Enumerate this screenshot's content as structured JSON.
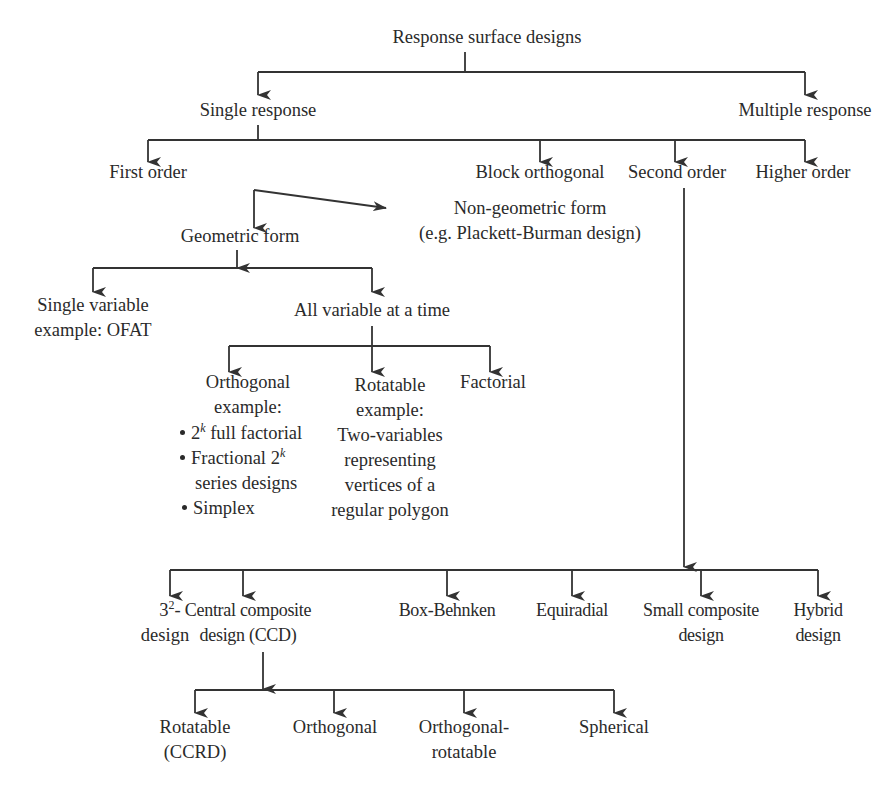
{
  "diagram": {
    "title": "Response surface designs",
    "level1": {
      "single": "Single response",
      "multiple": "Multiple response"
    },
    "level2": {
      "first_order": "First order",
      "block_orthogonal": "Block orthogonal",
      "second_order": "Second order",
      "higher_order": "Higher order"
    },
    "first_order_children": {
      "geometric": "Geometric form",
      "non_geometric_line1": "Non-geometric form",
      "non_geometric_line2": "(e.g. Plackett-Burman design)"
    },
    "geometric_children": {
      "single_variable_line1": "Single variable",
      "single_variable_line2": "example: OFAT",
      "all_variable": "All variable at a time"
    },
    "all_variable_children": {
      "orthogonal_line1": "Orthogonal",
      "orthogonal_line2": "example:",
      "orthogonal_bullets": [
        {
          "pre": "2",
          "sup": "k",
          "post": " full factorial"
        },
        {
          "pre": "Fractional 2",
          "sup": "k",
          "post": ""
        },
        {
          "cont": "series designs"
        },
        {
          "pre": "Simplex",
          "sup": "",
          "post": ""
        }
      ],
      "rotatable_lines": [
        "Rotatable",
        "example:",
        "Two-variables",
        "representing",
        "vertices of a",
        "regular polygon"
      ],
      "factorial": "Factorial"
    },
    "second_order_children": [
      {
        "pre": "3",
        "sup": "2",
        "post": "-",
        "line2": "design"
      },
      {
        "line1": "Central composite",
        "line2": "design (CCD)"
      },
      {
        "line1": "Box-Behnken"
      },
      {
        "line1": "Equiradial"
      },
      {
        "line1": "Small composite",
        "line2": "design"
      },
      {
        "line1": "Hybrid",
        "line2": "design"
      }
    ],
    "ccd_children": [
      {
        "line1": "Rotatable",
        "line2": "(CCRD)"
      },
      {
        "line1": "Orthogonal"
      },
      {
        "line1": "Orthogonal-",
        "line2": "rotatable"
      },
      {
        "line1": "Spherical"
      }
    ],
    "colors": {
      "line": "#333333",
      "text": "#2a2a2a",
      "background": "#ffffff"
    }
  }
}
